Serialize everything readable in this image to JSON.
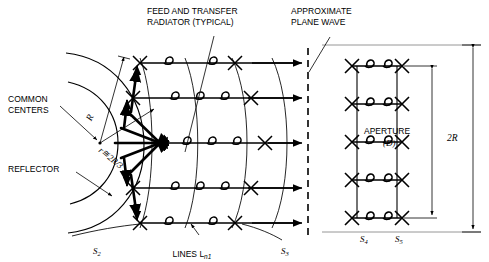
{
  "figure": {
    "type": "antenna-array-schematic",
    "title_labels": {
      "feed_transfer": "FEED AND TRANSFER\nRADIATOR (TYPICAL)",
      "plane_wave": "APPROXIMATE\nPLANE WAVE",
      "common_centers": "COMMON\nCENTERS",
      "reflector": "REFLECTOR",
      "aperture": "APERTURE",
      "aperture_sym": "(D)",
      "two_r": "2R",
      "lines": "LINES L",
      "lines_sub": "n1"
    },
    "radii": {
      "outer": "R",
      "inner": "r≅2R/3"
    },
    "surface_labels": [
      {
        "name": "S2",
        "base": "S",
        "sub": "2"
      },
      {
        "name": "S3",
        "base": "S",
        "sub": "3"
      },
      {
        "name": "S4",
        "base": "S",
        "sub": "4"
      },
      {
        "name": "S5",
        "base": "S",
        "sub": "5"
      }
    ],
    "counts": {
      "transmission_lines": 5,
      "plane_wave_arrows": 5,
      "array_elements": 5,
      "feed_arrows": 8
    },
    "colors": {
      "ink": "#000000",
      "frame": "#808080",
      "background": "#ffffff"
    }
  }
}
